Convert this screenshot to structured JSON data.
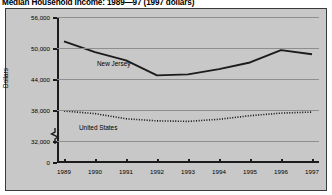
{
  "chart_data": {
    "type": "line",
    "title": "Median Household Income: 1989—97 (1997 dollars)",
    "xlabel": "",
    "ylabel": "Dollars",
    "categories": [
      "1989",
      "1990",
      "1991",
      "1992",
      "1993",
      "1994",
      "1995",
      "1996",
      "1997"
    ],
    "ylim": [
      32000,
      56000
    ],
    "yticks": [
      {
        "value": 0,
        "label": "0"
      },
      {
        "value": 32000,
        "label": "32,000"
      },
      {
        "value": 38000,
        "label": "38,000"
      },
      {
        "value": 44000,
        "label": "44,000"
      },
      {
        "value": 50000,
        "label": "50,000"
      },
      {
        "value": 56000,
        "label": "56,000"
      }
    ],
    "axis_break": true,
    "grid": true,
    "legend_position": "inline-labels",
    "series": [
      {
        "name": "New Jersey",
        "style": "solid",
        "color": "#1c1c1c",
        "values": [
          51300,
          49200,
          47600,
          44700,
          44900,
          45900,
          47200,
          49600,
          48800
        ]
      },
      {
        "name": "United States",
        "style": "dotted",
        "color": "#1c1c1c",
        "values": [
          37800,
          37300,
          36300,
          35900,
          35800,
          36200,
          36900,
          37400,
          37600
        ]
      }
    ]
  },
  "series_labels": {
    "new_jersey": "New Jersey",
    "united_states": "United States"
  }
}
